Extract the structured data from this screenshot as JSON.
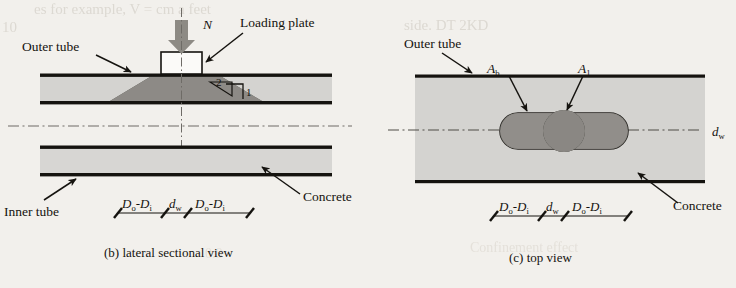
{
  "figure": {
    "background_color": "#f2f0ec",
    "ink_color": "#15130f",
    "concrete_fill": "#a9a6a0",
    "wedge_fill": "#3a3833",
    "capsule_fill": "#55524c",
    "core_fill": "#26241f",
    "load_arrow_color": "#8d8a84"
  },
  "panel_b": {
    "caption": "(b) lateral sectional view",
    "labels": {
      "outer_tube": "Outer tube",
      "inner_tube": "Inner tube",
      "concrete": "Concrete",
      "loading_plate": "Loading plate",
      "load_symbol": "N",
      "slope_rise": "2",
      "slope_run": "1"
    },
    "dimensions": [
      {
        "main": "D",
        "sub1": "o",
        "dash": "-D",
        "sub2": "i"
      },
      {
        "main": "d",
        "sub1": "w",
        "dash": "",
        "sub2": ""
      },
      {
        "main": "D",
        "sub1": "o",
        "dash": "-D",
        "sub2": "i"
      }
    ]
  },
  "panel_c": {
    "caption": "(c) top view",
    "labels": {
      "outer_tube": "Outer tube",
      "concrete": "Concrete",
      "area_b_main": "A",
      "area_b_sub": "b",
      "area_1_main": "A",
      "area_1_sub": "1",
      "dw_main": "d",
      "dw_sub": "w"
    },
    "dimensions": [
      {
        "main": "D",
        "sub1": "o",
        "dash": "-D",
        "sub2": "i"
      },
      {
        "main": "d",
        "sub1": "w",
        "dash": "",
        "sub2": ""
      },
      {
        "main": "D",
        "sub1": "o",
        "dash": "-D",
        "sub2": "i"
      }
    ]
  },
  "bleed_through": {
    "line_top_left": "es for example, V = cm a feet",
    "line_top_left2": "10",
    "line_top_right": "side. DT 2KD",
    "line_bottom_left": "0.8",
    "line_bottom_right": "Confinement effect"
  }
}
